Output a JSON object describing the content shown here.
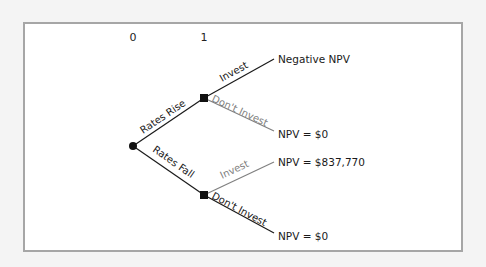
{
  "diagram": {
    "type": "decision-tree",
    "time_labels": [
      "0",
      "1"
    ],
    "root": {
      "kind": "chance-node",
      "shape": "circle"
    },
    "branches": [
      {
        "label": "Rates Rise",
        "node": "decision-node",
        "children": [
          {
            "label": "Invest",
            "outcome": "Negative NPV",
            "color": "#1a1a1a"
          },
          {
            "label": "Don't Invest",
            "outcome": "NPV = $0",
            "color": "#808080"
          }
        ]
      },
      {
        "label": "Rates Fall",
        "node": "decision-node",
        "children": [
          {
            "label": "Invest",
            "outcome": "NPV = $837,770",
            "color": "#808080"
          },
          {
            "label": "Don't Invest",
            "outcome": "NPV = $0",
            "color": "#1a1a1a"
          }
        ]
      }
    ],
    "colors": {
      "frame_border": "#a6a6a6",
      "background": "#f4f4f4",
      "chosen_branch": "#1a1a1a",
      "rejected_branch": "#808080"
    }
  }
}
